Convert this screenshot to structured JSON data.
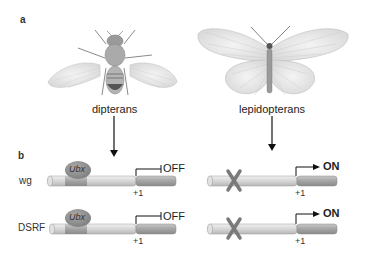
{
  "panels": {
    "a": {
      "label": "a",
      "species": [
        {
          "name": "dipterans",
          "icon": "fly-icon"
        },
        {
          "name": "lepidopterans",
          "icon": "butterfly-icon"
        }
      ]
    },
    "b": {
      "label": "b",
      "genes": [
        "wg",
        "DSRF"
      ],
      "repressor": "Ubx",
      "tss_label": "+1",
      "dipteran_state": "OFF",
      "lepidopteran_state": "ON"
    }
  },
  "colors": {
    "rod_light": "#d8d8d8",
    "rod_dark": "#a8a8a8",
    "ubx": "#8c8c8c",
    "cross": "#7a7a7a",
    "line": "#111111"
  }
}
